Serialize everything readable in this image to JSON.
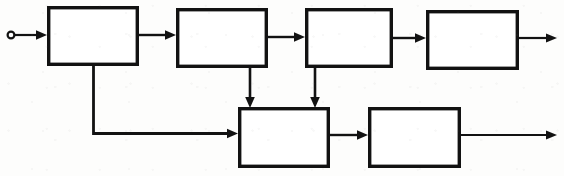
{
  "diagram": {
    "kind": "block-diagram",
    "style": "hand-drawn scanned line art",
    "canvas": {
      "width": 564,
      "height": 176
    },
    "colors": {
      "ink": "#121212",
      "paper": "#fdfdfc",
      "block_fill": "#ffffff"
    },
    "stroke": {
      "block_width": 3.4,
      "connector_width": 2.2,
      "arrow_head_length": 9,
      "arrow_head_width": 8
    },
    "blocks": [
      {
        "id": "block-1",
        "name": "block-1",
        "label": "",
        "x": 47,
        "y": 6,
        "w": 92,
        "h": 60
      },
      {
        "id": "block-2",
        "name": "block-2",
        "label": "",
        "x": 176,
        "y": 8,
        "w": 92,
        "h": 60
      },
      {
        "id": "block-3",
        "name": "block-3",
        "label": "",
        "x": 305,
        "y": 8,
        "w": 88,
        "h": 60
      },
      {
        "id": "block-4",
        "name": "block-4",
        "label": "",
        "x": 426,
        "y": 10,
        "w": 93,
        "h": 60
      },
      {
        "id": "block-5",
        "name": "block-5",
        "label": "",
        "x": 238,
        "y": 107,
        "w": 92,
        "h": 61
      },
      {
        "id": "block-6",
        "name": "block-6",
        "label": "",
        "x": 368,
        "y": 107,
        "w": 93,
        "h": 61
      }
    ],
    "terminals": [
      {
        "id": "input-terminal",
        "name": "input-terminal",
        "cx": 11,
        "cy": 35,
        "r": 3.4
      }
    ],
    "connectors": [
      {
        "id": "input-to-block-1",
        "name": "connector-input-to-block-1",
        "points": "15,35 47,35",
        "arrow": "end-right"
      },
      {
        "id": "block-1-to-block-2",
        "name": "connector-block-1-to-block-2",
        "points": "139,35 176,35",
        "arrow": "end-right"
      },
      {
        "id": "block-2-to-block-3",
        "name": "connector-block-2-to-block-3",
        "points": "268,37 305,37",
        "arrow": "end-right"
      },
      {
        "id": "block-3-to-block-4",
        "name": "connector-block-3-to-block-4",
        "points": "393,38 426,38",
        "arrow": "end-right"
      },
      {
        "id": "block-4-to-output",
        "name": "connector-block-4-to-output",
        "points": "519,38 556,38",
        "arrow": "end-right"
      },
      {
        "id": "block-1-to-block-5",
        "name": "connector-block-1-feedforward-to-block-5",
        "points": "93,66 93,133 238,133",
        "arrow": "end-right"
      },
      {
        "id": "block-2-to-block-5",
        "name": "connector-block-2-to-block-5",
        "points": "250,68 250,107",
        "arrow": "end-down"
      },
      {
        "id": "block-3-to-block-5",
        "name": "connector-block-3-to-block-5",
        "points": "315,68 315,107",
        "arrow": "end-down"
      },
      {
        "id": "block-5-to-block-6",
        "name": "connector-block-5-to-block-6",
        "points": "330,135 368,135",
        "arrow": "end-right"
      },
      {
        "id": "block-6-to-output",
        "name": "connector-block-6-to-output",
        "points": "461,135 556,135",
        "arrow": "end-right"
      }
    ]
  }
}
